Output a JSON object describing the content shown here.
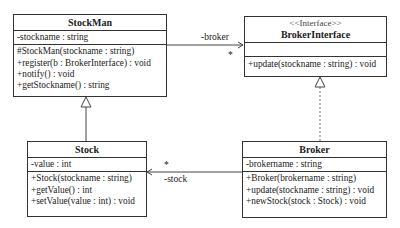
{
  "diagram": {
    "type": "UML class diagram",
    "classes": {
      "stockman": {
        "name": "StockMan",
        "attributes": [
          "-stockname : string"
        ],
        "operations": [
          "#StockMan(stockname : string)",
          "+register(b : BrokerInterface) : void",
          "+notify() : void",
          "+getStockname() : string"
        ]
      },
      "brokerinterface": {
        "stereotype": "<<Interface>>",
        "name": "BrokerInterface",
        "attributes": [],
        "operations": [
          "+update(stockname : string) : void"
        ]
      },
      "stock": {
        "name": "Stock",
        "attributes": [
          "-value : int"
        ],
        "operations": [
          "+Stock(stockname : string)",
          "+getValue() : int",
          "+setValue(value : int) : void"
        ]
      },
      "broker": {
        "name": "Broker",
        "attributes": [
          "-brokername : string"
        ],
        "operations": [
          "+Broker(brokername : string)",
          "+update(stockname : string) : void",
          "+newStock(stock : Stock) : void"
        ]
      }
    },
    "relations": {
      "stockman_broker": {
        "role": "-broker",
        "multiplicity": "*"
      },
      "broker_stock": {
        "role": "-stock",
        "multiplicity": "*"
      }
    }
  }
}
